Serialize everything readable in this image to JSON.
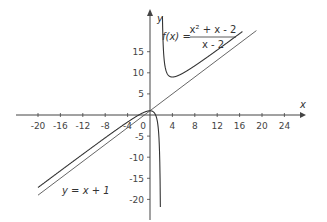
{
  "chart_data": {
    "type": "line",
    "title": "",
    "xlabel": "x",
    "ylabel": "y",
    "xlim": [
      -22,
      27
    ],
    "ylim": [
      -22,
      20
    ],
    "grid": false,
    "x_ticks": [
      -20,
      -16,
      -12,
      -8,
      -4,
      0,
      4,
      8,
      12,
      16,
      20,
      24
    ],
    "x_tick_labels": [
      "-20",
      "-16",
      "-12",
      "-8",
      "-4",
      "0",
      "4",
      "8",
      "12",
      "16",
      "20",
      "24"
    ],
    "y_ticks": [
      15,
      10,
      5,
      -5,
      -10,
      -15,
      -20
    ],
    "y_tick_labels": [
      "15",
      "10",
      "5",
      "-5",
      "-10",
      "-15",
      "-20"
    ],
    "series": [
      {
        "name": "f(x) = (x^2 + x - 2)/(x - 2)",
        "kind": "rational function with vertical asymptote x = 2",
        "x": [
          -20,
          -16,
          -12,
          -8,
          -4,
          0,
          1,
          1.5,
          1.8,
          1.9,
          2.1,
          2.2,
          2.5,
          3,
          4,
          5,
          6,
          8,
          10,
          12,
          14,
          16
        ],
        "values": [
          -17.18,
          -13.22,
          -9.29,
          -5.4,
          -1.67,
          1,
          0,
          -3.5,
          -16.6,
          -36.9,
          43.1,
          23.2,
          12.5,
          10,
          9,
          9.33,
          10,
          11.67,
          13.5,
          15.4,
          17.33,
          19.29
        ]
      },
      {
        "name": "y = x + 1",
        "kind": "oblique asymptote",
        "x": [
          -20,
          19
        ],
        "values": [
          -19,
          20
        ]
      }
    ],
    "annotations": [
      {
        "text": "f(x) = (x² + x - 2)/(x - 2)",
        "near": [
          3,
          19
        ]
      },
      {
        "text": "y = x + 1",
        "near": [
          -13,
          -19
        ]
      }
    ]
  },
  "labels": {
    "x_axis": "x",
    "y_axis": "y",
    "fx_lhs": "f(x) =",
    "fx_num": "x² + x - 2",
    "fx_den": "x - 2",
    "asymptote": "y = x + 1"
  },
  "colors": {
    "axis": "#444444",
    "curve": "#333333",
    "asymptote": "#555555"
  }
}
